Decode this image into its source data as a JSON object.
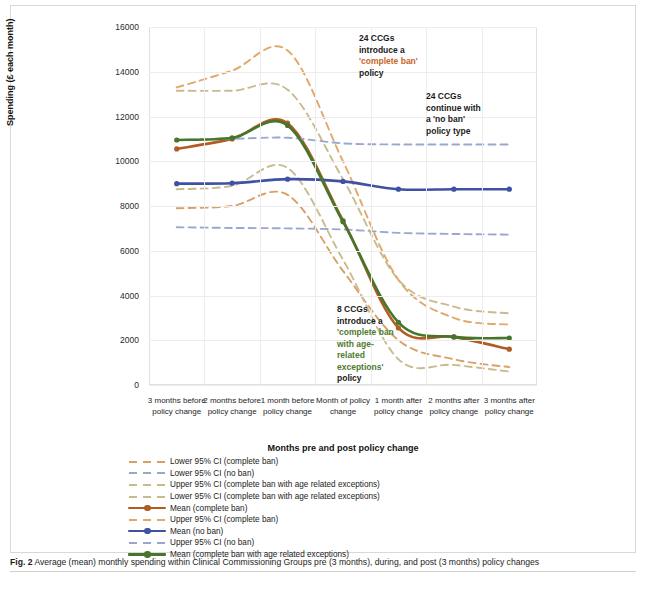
{
  "figure": {
    "caption_label": "Fig. 2",
    "caption_text": "Average (mean) monthly spending within Clinical Commissioning Groups pre (3 months), during, and post (3 months) policy changes"
  },
  "annotations": [
    {
      "id": "complete-ban",
      "line1": "24 CCGs",
      "line2": "introduce a",
      "quoted": "'complete ban'",
      "tail": " policy",
      "color": "#c8651f"
    },
    {
      "id": "no-ban",
      "line1": "24 CCGs",
      "line2": "continue with",
      "line3": "a 'no ban'",
      "line4": "policy type",
      "color": "#1b1b1b"
    },
    {
      "id": "age-related",
      "line1": "8 CCGs",
      "line2": "introduce a",
      "quoted": "'complete ban with age-related exceptions'",
      "tail": "policy",
      "color": "#4e7a2e"
    }
  ],
  "chart_data": {
    "type": "line",
    "title": "",
    "xlabel": "Months pre and post policy change",
    "ylabel": "Spending (£ each month)",
    "ylim": [
      0,
      16000
    ],
    "ytick_values": [
      0,
      2000,
      4000,
      6000,
      8000,
      10000,
      12000,
      14000,
      16000
    ],
    "ytick_labels": [
      "0",
      "2000",
      "4000",
      "6000",
      "8000",
      "10000",
      "12000",
      "14000",
      "16000"
    ],
    "grid": true,
    "legend_position": "below",
    "categories": [
      "3 months before policy change",
      "2 months before policy change",
      "1 month before policy change",
      "Month of policy change",
      "1 month after policy change",
      "2 months after policy change",
      "3 months after policy change"
    ],
    "series": [
      {
        "name": "Lower 95% CI (complete ban)",
        "style": "dashed",
        "color": "#d9a066",
        "values": [
          7900,
          8000,
          8500,
          5100,
          2000,
          1150,
          800
        ]
      },
      {
        "name": "Lower 95% CI (no ban)",
        "style": "dashed",
        "color": "#9aa8d0",
        "values": [
          7050,
          7020,
          7000,
          6950,
          6800,
          6750,
          6720
        ]
      },
      {
        "name": "Upper 95% CI (complete ban with age related exceptions)",
        "style": "dashed",
        "color": "#c9bb8e",
        "values": [
          13150,
          13150,
          13200,
          9200,
          4700,
          3500,
          3200
        ]
      },
      {
        "name": "Lower 95% CI (complete ban with age related exceptions)",
        "style": "dashed",
        "color": "#c9bb8e",
        "values": [
          8750,
          8900,
          9700,
          5600,
          1150,
          900,
          600
        ]
      },
      {
        "name": "Mean (complete ban)",
        "style": "solid-marker",
        "color": "#b05c23",
        "values": [
          10550,
          11000,
          11700,
          7350,
          2550,
          2150,
          1600
        ]
      },
      {
        "name": "Upper 95% CI (complete ban)",
        "style": "dashed",
        "color": "#e0a86a",
        "values": [
          13300,
          14050,
          14950,
          10000,
          4700,
          3000,
          2700
        ]
      },
      {
        "name": "Mean (no ban)",
        "style": "solid-marker",
        "color": "#3f51a3",
        "values": [
          9000,
          9020,
          9200,
          9100,
          8750,
          8750,
          8750
        ]
      },
      {
        "name": "Upper 95% CI (no ban)",
        "style": "dashed",
        "color": "#9aa8d0",
        "values": [
          10950,
          11000,
          11050,
          10800,
          10750,
          10750,
          10750
        ]
      },
      {
        "name": "Mean (complete ban with age related exceptions)",
        "style": "solid-marker",
        "color": "#46762c",
        "values": [
          10950,
          11050,
          11600,
          7300,
          2800,
          2150,
          2100
        ]
      }
    ]
  },
  "legend": {
    "items": [
      {
        "label": "Lower 95% CI (complete ban)",
        "style": "dashed",
        "color": "#d9a066"
      },
      {
        "label": "Lower 95% CI (no ban)",
        "style": "dashed",
        "color": "#9aa8d0"
      },
      {
        "label": "Upper 95% CI (complete ban with age related exceptions)",
        "style": "dashed",
        "color": "#c9bb8e"
      },
      {
        "label": "Lower 95% CI (complete ban with age related exceptions)",
        "style": "dashed",
        "color": "#c9bb8e"
      },
      {
        "label": "Mean (complete ban)",
        "style": "solid-marker",
        "color": "#b05c23"
      },
      {
        "label": "Upper 95% CI (complete ban)",
        "style": "dashed",
        "color": "#e0a86a"
      },
      {
        "label": "Mean (no ban)",
        "style": "solid-marker",
        "color": "#3f51a3"
      },
      {
        "label": "Upper 95% CI (no ban)",
        "style": "dashed",
        "color": "#9aa8d0"
      },
      {
        "label": "Mean (complete ban with age related exceptions)",
        "style": "solid-marker",
        "color": "#46762c"
      }
    ]
  }
}
